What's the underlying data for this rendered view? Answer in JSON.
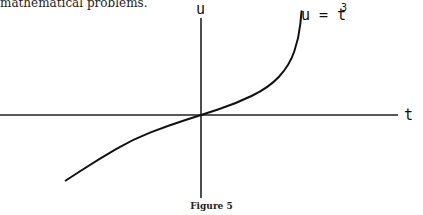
{
  "snippet_text": "mathematical problems.",
  "caption": "Figure 5",
  "chart_data": {
    "type": "line",
    "title": "",
    "function_label": "u = t",
    "function_label_exponent": "3",
    "xlabel": "t",
    "ylabel": "u",
    "grid": false,
    "series": [
      {
        "name": "u = t^3",
        "description": "S-shaped curve through the origin, steep near the top-right end and flattening near the origin",
        "points": [
          [
            -1.0,
            -0.6
          ],
          [
            -0.75,
            -0.4
          ],
          [
            -0.5,
            -0.22
          ],
          [
            -0.25,
            -0.1
          ],
          [
            0,
            0
          ],
          [
            0.25,
            0.1
          ],
          [
            0.5,
            0.25
          ],
          [
            0.65,
            0.45
          ],
          [
            0.72,
            0.7
          ],
          [
            0.74,
            0.95
          ]
        ]
      }
    ]
  }
}
